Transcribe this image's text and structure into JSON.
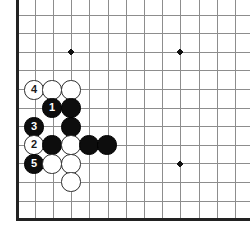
{
  "diagram": {
    "type": "go-board-diagram",
    "board": {
      "edges_visible": [
        "left",
        "bottom"
      ],
      "edge_color": "#222222",
      "line_color": "#8d8d8d",
      "background_color": "#ffffff",
      "left_edge_x": 17,
      "bottom_edge_y": 219,
      "col_spacing": 18.2,
      "row_spacing": 18.6,
      "first_row_y": 15,
      "cols_visible": 13,
      "rows_visible": 11
    },
    "star_points": [
      {
        "col": 3,
        "row": 2,
        "x": 71,
        "y": 52
      },
      {
        "col": 9,
        "row": 2,
        "x": 180,
        "y": 52
      },
      {
        "col": 9,
        "row": 8,
        "x": 180,
        "y": 164
      }
    ],
    "stones": [
      {
        "color": "white",
        "label": "4",
        "col": 0,
        "row": 4,
        "x": 34,
        "y": 90
      },
      {
        "color": "white",
        "label": "",
        "col": 1,
        "row": 4,
        "x": 52,
        "y": 90
      },
      {
        "color": "white",
        "label": "",
        "col": 2,
        "row": 4,
        "x": 71,
        "y": 90
      },
      {
        "color": "black",
        "label": "1",
        "col": 1,
        "row": 5,
        "x": 52,
        "y": 108
      },
      {
        "color": "black",
        "label": "",
        "col": 2,
        "row": 5,
        "x": 71,
        "y": 108
      },
      {
        "color": "black",
        "label": "3",
        "col": 0,
        "row": 6,
        "x": 34,
        "y": 127
      },
      {
        "color": "black",
        "label": "",
        "col": 2,
        "row": 6,
        "x": 71,
        "y": 127
      },
      {
        "color": "white",
        "label": "2",
        "col": 0,
        "row": 7,
        "x": 34,
        "y": 145
      },
      {
        "color": "black",
        "label": "",
        "col": 1,
        "row": 7,
        "x": 52,
        "y": 145
      },
      {
        "color": "white",
        "label": "",
        "col": 2,
        "row": 7,
        "x": 71,
        "y": 145
      },
      {
        "color": "black",
        "label": "",
        "col": 3,
        "row": 7,
        "x": 89,
        "y": 145
      },
      {
        "color": "black",
        "label": "",
        "col": 4,
        "row": 7,
        "x": 107,
        "y": 145
      },
      {
        "color": "black",
        "label": "5",
        "col": 0,
        "row": 8,
        "x": 34,
        "y": 164
      },
      {
        "color": "white",
        "label": "",
        "col": 1,
        "row": 8,
        "x": 52,
        "y": 164
      },
      {
        "color": "white",
        "label": "",
        "col": 2,
        "row": 8,
        "x": 71,
        "y": 164
      },
      {
        "color": "white",
        "label": "",
        "col": 2,
        "row": 9,
        "x": 71,
        "y": 182
      }
    ],
    "move_sequence": [
      {
        "number": "1",
        "color": "black"
      },
      {
        "number": "2",
        "color": "white"
      },
      {
        "number": "3",
        "color": "black"
      },
      {
        "number": "4",
        "color": "white"
      },
      {
        "number": "5",
        "color": "black"
      }
    ]
  }
}
